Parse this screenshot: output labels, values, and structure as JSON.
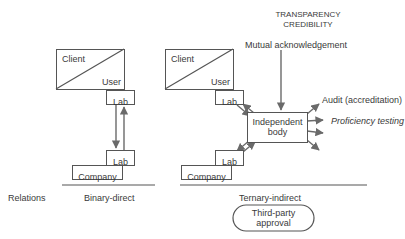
{
  "header": {
    "line1": "TRANSPARENCY",
    "line2": "CREDIBILITY"
  },
  "left_model": {
    "client_label": "Client",
    "user_label": "User",
    "lab_top": "Lab",
    "lab_bottom": "Lab",
    "company": "Company",
    "caption": "Binary-direct"
  },
  "right_model": {
    "client_label": "Client",
    "user_label": "User",
    "lab_top": "Lab",
    "lab_bottom": "Lab",
    "company": "Company",
    "independent_body": "Independent body",
    "independent_line1": "Independent",
    "independent_line2": "body",
    "mutual": "Mutual acknowledgement",
    "audit": "Audit (accreditation)",
    "proficiency": "Proficiency testing",
    "caption": "Ternary-indirect",
    "approval_line1": "Third-party",
    "approval_line2": "approval"
  },
  "row_label": "Relations",
  "colors": {
    "line": "#555555",
    "arrow": "#6a6a6a",
    "text": "#3a3a3a"
  }
}
